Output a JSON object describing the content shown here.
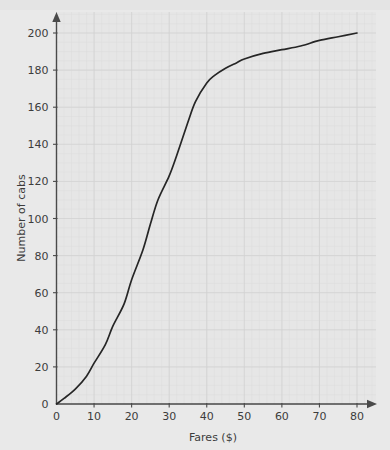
{
  "chart_data": {
    "type": "line",
    "title": "",
    "subtitle": "",
    "xlabel": "Fares ($)",
    "ylabel": "Number of cabs",
    "xlim": [
      0,
      85
    ],
    "ylim": [
      0,
      208
    ],
    "xticks": [
      0,
      10,
      20,
      30,
      40,
      50,
      60,
      70,
      80
    ],
    "yticks": [
      0,
      20,
      40,
      60,
      80,
      100,
      120,
      140,
      160,
      180,
      200
    ],
    "xtick_labels": [
      "0",
      "10",
      "20",
      "30",
      "40",
      "50",
      "60",
      "70",
      "80"
    ],
    "ytick_labels": [
      "0",
      "20",
      "40",
      "60",
      "80",
      "100",
      "120",
      "140",
      "160",
      "180",
      "200"
    ],
    "grid": true,
    "grid_style": "fine graph paper, minor 2 units, major 10 units",
    "legend": false,
    "legend_position": "none",
    "annotations": [],
    "series": [
      {
        "name": "Cumulative number of cabs",
        "color": "#262626",
        "x": [
          0,
          2,
          5,
          8,
          10,
          13,
          15,
          18,
          20,
          23,
          25,
          27,
          30,
          32,
          35,
          37,
          40,
          42,
          45,
          48,
          50,
          55,
          60,
          65,
          70,
          75,
          80
        ],
        "values": [
          0,
          3,
          8,
          15,
          22,
          32,
          42,
          54,
          67,
          83,
          97,
          110,
          123,
          134,
          152,
          163,
          173,
          177,
          181,
          184,
          186,
          189,
          191,
          193,
          196,
          198,
          200
        ]
      }
    ]
  },
  "axes": {
    "x_axis_label": "Fares ($)",
    "y_axis_label": "Number of cabs",
    "x_arrow": "arrow-right",
    "y_arrow": "arrow-up"
  },
  "colors": {
    "background": "#e9e9e9",
    "plot_background": "#e6e6e6",
    "curve": "#262626",
    "axis": "#4a4a4a",
    "grid_minor": "#dcdcdc",
    "grid_major": "#d2d2d2",
    "text": "#3c3c3c"
  }
}
